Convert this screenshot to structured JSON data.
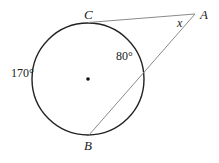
{
  "diagram": {
    "type": "geometry",
    "circle": {
      "cx": 88,
      "cy": 79,
      "r": 56,
      "stroke": "#222222",
      "center_dot": true
    },
    "points": {
      "A": {
        "label": "A",
        "x": 195,
        "y": 13
      },
      "B": {
        "label": "B",
        "x": 88,
        "y": 136
      },
      "C": {
        "label": "C",
        "x": 88,
        "y": 22
      }
    },
    "segments": [
      {
        "from": "C",
        "to": "A",
        "note": "tangent"
      },
      {
        "from": "B",
        "to": "A",
        "note": "secant"
      }
    ],
    "labels": {
      "angle_x": "x",
      "arc_near": "80°",
      "arc_far": "170°",
      "point_a": "A",
      "point_b": "B",
      "point_c": "C"
    },
    "line_color": "#8a8a8a"
  }
}
